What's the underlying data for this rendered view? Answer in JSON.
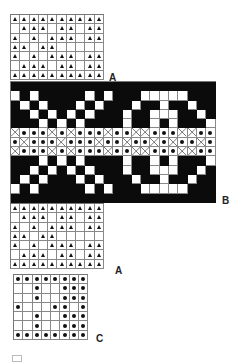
{
  "chart_data": {
    "type": "diagram",
    "title": "",
    "cell_size_px": 9.3,
    "symbols": {
      "tri": "triangle stitch",
      "dot": "dot stitch",
      "x": "cross stitch",
      "k": "black (filled) square",
      "w": "white (empty) square"
    },
    "sections": [
      {
        "id": "A-top",
        "label": "A",
        "x": 10,
        "y": 14,
        "cols": 10,
        "rows": [
          "TTTTTTTTTT",
          ".TTT.TT.TT",
          "T.T.TTT.TT",
          "TT.TT.....",
          "T.T.TTT.TT",
          ".TTT.TT.TT",
          "TTTTTTTTTT"
        ]
      },
      {
        "id": "B-band",
        "label": "B",
        "x": 10,
        "y": 81,
        "cols": 22,
        "rows": [
          "KKKKKKKKKKKKKKKKKKKKKK",
          "WKWKKKKKWKWKKKWWWWWKKK",
          "KWKWKKKWKWKKKWKKWKKWKK",
          "KKWKWKWKWKKKWKKWWWKKWK",
          "KKKWKWKWKKKKWKKWKWKKKW",
          "XDDDXDXDDDXDDXXDDDXXDD",
          "DXDDDXDDDXDDXDDXDXDDXD",
          "XDDDXDXDDDXDDXXDDDXXDD",
          "KKKWKWKWKKKKWKKWKWKKKW",
          "KKWKWKWKWKKKWKKWWWKKWK",
          "KWKWKKKWKWKKKWKKWKKWKK",
          "WKWKKKKKWKWKKKWWWWWKKK",
          "KKKKKKKKKKKKKKKKKKKKKK"
        ]
      },
      {
        "id": "A-bottom",
        "label": "A",
        "x": 10,
        "y": 203,
        "cols": 10,
        "rows": [
          "TTTTTTTTTT",
          ".TTT.TT.TT",
          "T.T.TTT.TT",
          "TT.TT.....",
          "T.T.TTT.TT",
          ".TTT.TT.TT",
          "TTTTTTTTTT"
        ]
      },
      {
        "id": "C-block",
        "label": "C",
        "x": 13,
        "y": 274,
        "cols": 8,
        "rows": [
          "DDDDDDDD",
          "..D..DDD",
          "..D..DDD",
          "D...DD.D",
          "..D..DDD",
          "..D..DDD",
          "DDDDDDDD"
        ]
      }
    ],
    "labels": [
      {
        "text": "A",
        "x": 109,
        "y": 72
      },
      {
        "text": "B",
        "x": 222,
        "y": 195
      },
      {
        "text": "A",
        "x": 115,
        "y": 265
      },
      {
        "text": "C",
        "x": 96,
        "y": 333
      }
    ]
  }
}
